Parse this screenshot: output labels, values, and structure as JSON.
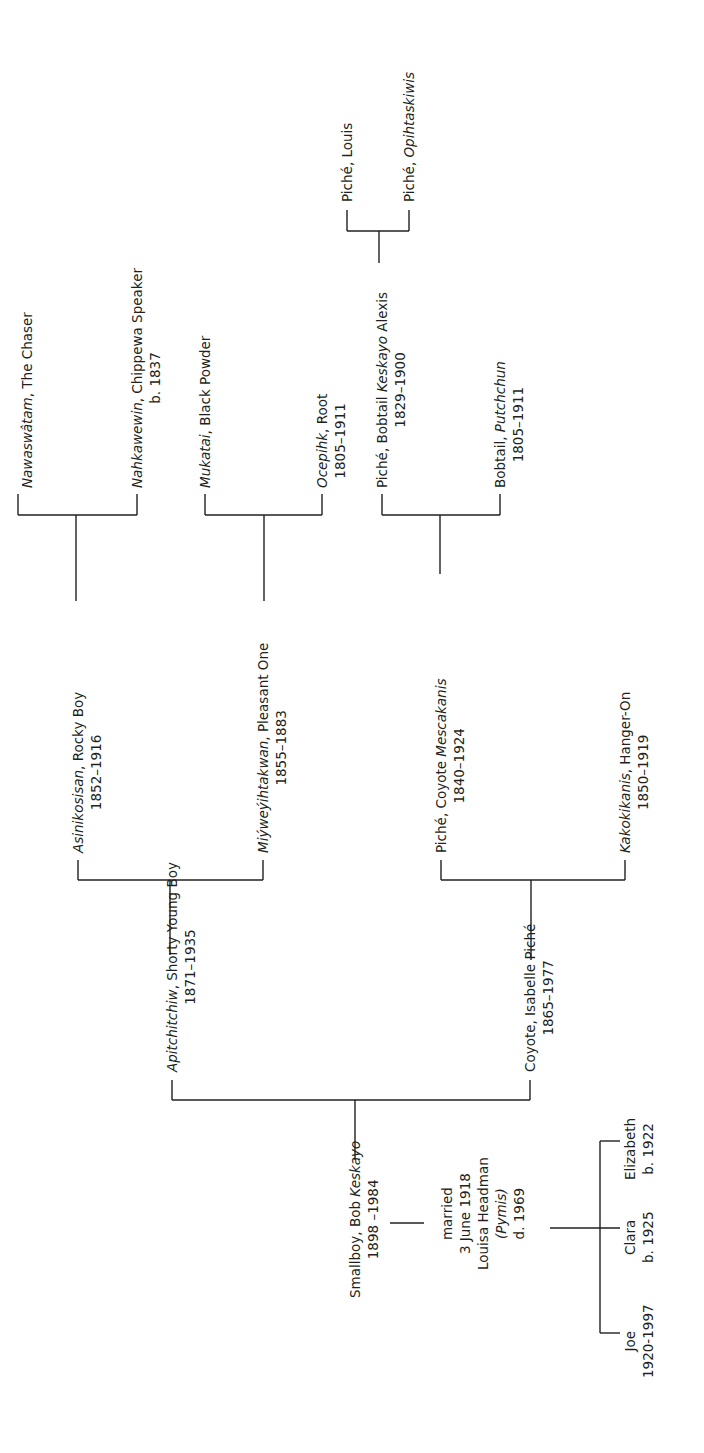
{
  "diagram": {
    "type": "family-tree",
    "orientation": "rotated -90deg (read bottom-to-top)",
    "line_color": "#231f20",
    "background": "#ffffff"
  },
  "people": {
    "nawaswatam": {
      "name_italic": "Nawaswâtam",
      "name_rest": ", The Chaser"
    },
    "nahkawewin": {
      "name_italic": "Nahkawewin",
      "name_rest": ", Chippewa Speaker",
      "dates": "b. 1837"
    },
    "mukatai": {
      "name_italic": "Mukatai",
      "name_rest": ", Black Powder"
    },
    "ocepihk": {
      "name_italic": "Ocepihk",
      "name_rest": ", Root",
      "dates": "1805–1911"
    },
    "piche_louis": {
      "name_plain": "Piché, Louis"
    },
    "piche_opihtaskiwis": {
      "name_plain": "Piché, ",
      "name_italic": "Opihtaskiwis"
    },
    "piche_bobtail": {
      "name_plain": "Piché, Bobtail ",
      "name_italic": "Keskayo",
      "name_rest": " Alexis",
      "dates": "1829–1900"
    },
    "bobtail_putchchun": {
      "name_plain": "Bobtail, ",
      "name_italic": "Putchchun",
      "dates": "1805–1911"
    },
    "asinikosisan": {
      "name_italic": "Asinikosisan",
      "name_rest": ", Rocky Boy",
      "dates": "1852–1916"
    },
    "miyweyihtakwan": {
      "name_italic": "Miýweýihtakwan",
      "name_rest": ", Pleasant One",
      "dates": "1855–1883"
    },
    "piche_coyote": {
      "name_plain": "Piché, Coyote ",
      "name_italic": "Mescakanis",
      "dates": "1840–1924"
    },
    "kakokikanis": {
      "name_italic": "Kakokikanis",
      "name_rest": ", Hanger-On",
      "dates": "1850–1919"
    },
    "apitchitchiw": {
      "name_italic": "Apitchitchiw",
      "name_rest": ", Shorty Young Boy",
      "dates": "1871–1935"
    },
    "coyote_isabelle": {
      "name_plain": "Coyote, Isabelle Piché",
      "dates": "1865–1977"
    },
    "smallboy_bob": {
      "name_plain": "Smallboy, Bob ",
      "name_italic": "Keskayo",
      "dates": "1898 –1984"
    },
    "marriage": {
      "line1": "married",
      "line2": "3 June 1918",
      "line3": "Louisa Headman",
      "line4": "(Pymis)",
      "line5": "d. 1969"
    },
    "joe": {
      "name_plain": "Joe",
      "dates": "1920-1997"
    },
    "clara": {
      "name_plain": "Clara",
      "dates": "b. 1925"
    },
    "elizabeth": {
      "name_plain": "Elizabeth",
      "dates": "b. 1922"
    }
  },
  "relationships": [
    {
      "child": "asinikosisan",
      "parents": [
        "nawaswatam",
        "nahkawewin"
      ]
    },
    {
      "child": "miyweyihtakwan",
      "parents": [
        "mukatai",
        "ocepihk"
      ]
    },
    {
      "child": "piche_bobtail",
      "parents": [
        "piche_louis",
        "piche_opihtaskiwis"
      ]
    },
    {
      "child": "piche_coyote",
      "parents": [
        "piche_bobtail",
        "bobtail_putchchun"
      ]
    },
    {
      "child": "apitchitchiw",
      "parents": [
        "asinikosisan",
        "miyweyihtakwan"
      ]
    },
    {
      "child": "coyote_isabelle",
      "parents": [
        "piche_coyote",
        "kakokikanis"
      ]
    },
    {
      "child": "smallboy_bob",
      "parents": [
        "apitchitchiw",
        "coyote_isabelle"
      ]
    },
    {
      "spouses": [
        "smallboy_bob",
        "louisa_headman"
      ],
      "children": [
        "joe",
        "clara",
        "elizabeth"
      ]
    }
  ]
}
